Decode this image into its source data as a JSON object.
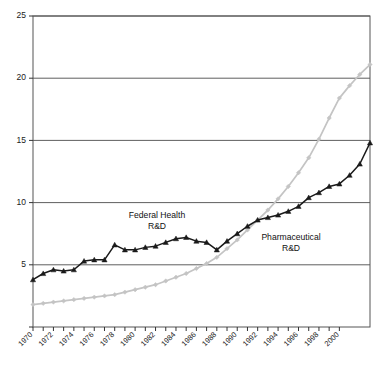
{
  "chart_data": {
    "type": "line",
    "title": "",
    "subtitle": "",
    "xlabel": "",
    "ylabel": "",
    "xlim": [
      1970,
      2003
    ],
    "ylim": [
      0,
      25
    ],
    "yticks": [
      0,
      5,
      10,
      15,
      20,
      25
    ],
    "ytick_labels": [
      "",
      "5",
      "10",
      "15",
      "20",
      "25"
    ],
    "grid": "horizontal",
    "legend_position": "inline-annotations",
    "x": [
      1970,
      1971,
      1972,
      1973,
      1974,
      1975,
      1976,
      1977,
      1978,
      1979,
      1980,
      1981,
      1982,
      1983,
      1984,
      1985,
      1986,
      1987,
      1988,
      1989,
      1990,
      1991,
      1992,
      1993,
      1994,
      1995,
      1996,
      1997,
      1998,
      1999,
      2000,
      2001,
      2002,
      2003
    ],
    "xtick_labels": [
      "1970",
      "1972",
      "1974",
      "1976",
      "1978",
      "1980",
      "1982",
      "1984",
      "1986",
      "1988",
      "1990",
      "1992",
      "1994",
      "1996",
      "1998",
      "2000"
    ],
    "series": [
      {
        "name": "Federal Health R&D",
        "color": "#1a1a1a",
        "marker": "triangle",
        "annotation": "Federal Health\nR&D",
        "annotation_line1": "Federal Health",
        "annotation_line2": "R&D",
        "values": [
          3.8,
          4.3,
          4.6,
          4.5,
          4.6,
          5.3,
          5.4,
          5.4,
          6.6,
          6.2,
          6.2,
          6.4,
          6.5,
          6.8,
          7.1,
          7.2,
          6.9,
          6.8,
          6.2,
          6.9,
          7.5,
          8.1,
          8.6,
          8.8,
          9.0,
          9.3,
          9.7,
          10.4,
          10.8,
          11.3,
          11.5,
          12.2,
          13.1,
          14.8
        ]
      },
      {
        "name": "Pharmaceutical R&D",
        "color": "#c4c4c4",
        "marker": "diamond",
        "annotation": "Pharmaceutical\nR&D",
        "annotation_line1": "Pharmaceutical",
        "annotation_line2": "R&D",
        "values": [
          1.8,
          1.9,
          2.0,
          2.1,
          2.2,
          2.3,
          2.4,
          2.5,
          2.6,
          2.8,
          3.0,
          3.2,
          3.4,
          3.7,
          4.0,
          4.3,
          4.7,
          5.1,
          5.6,
          6.3,
          7.0,
          7.8,
          8.6,
          9.4,
          10.3,
          11.3,
          12.4,
          13.6,
          15.1,
          16.8,
          18.4,
          19.4,
          20.3,
          21.1
        ]
      }
    ]
  },
  "axes": {
    "plot_left": 33,
    "plot_right": 370,
    "plot_top": 16,
    "plot_bottom": 327
  }
}
